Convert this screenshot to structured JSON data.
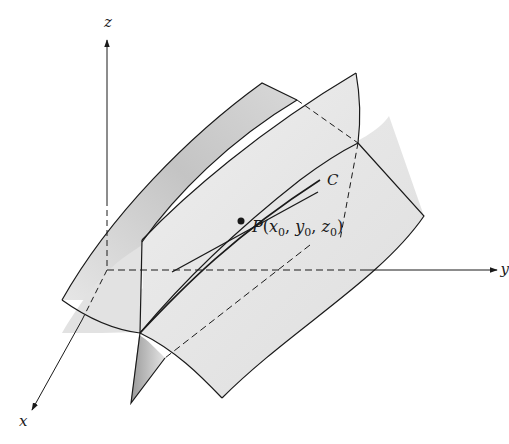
{
  "figure": {
    "axes": {
      "x_label": "x",
      "y_label": "y",
      "z_label": "z"
    },
    "curve_label": "C",
    "point": {
      "name": "P",
      "open": "(",
      "x_var": "x",
      "y_var": "y",
      "z_var": "z",
      "subscript": "0",
      "sep": ", ",
      "close": ")"
    },
    "colors": {
      "line": "#1a1a1a",
      "surface_light": "#e8e8e8",
      "surface_mid": "#d2d2d2",
      "surface_dark": "#a8a8a8",
      "background": "#ffffff"
    }
  }
}
